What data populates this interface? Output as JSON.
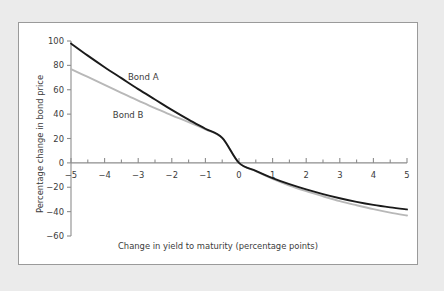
{
  "figure": {
    "background_color": "#ebebeb",
    "panel_color": "#ffffff",
    "border_color": "#9a9a9a"
  },
  "chart_data": {
    "type": "line",
    "title": "",
    "subtitle": "",
    "xlabel": "Change in yield to maturity (percentage points)",
    "ylabel": "Percentage change in bond price",
    "xlim": [
      -5,
      5
    ],
    "ylim": [
      -60,
      100
    ],
    "xticks": [
      -5,
      -4,
      -3,
      -2,
      -1,
      0,
      1,
      2,
      3,
      4,
      5
    ],
    "xtick_labels": [
      "−5",
      "−4",
      "−3",
      "−2",
      "−1",
      "0",
      "1",
      "2",
      "3",
      "4",
      "5"
    ],
    "x_minor_tick_interval": 0.5,
    "yticks": [
      -60,
      -40,
      -20,
      0,
      20,
      40,
      60,
      80,
      100
    ],
    "ytick_labels": [
      "−60",
      "−40",
      "−20",
      "0",
      "20",
      "40",
      "60",
      "80",
      "100"
    ],
    "grid": false,
    "legend_position": "inline-annotation",
    "axis_color": "#8d8d8d",
    "x": [
      -5,
      -4.5,
      -4,
      -3.5,
      -3,
      -2.5,
      -2,
      -1.5,
      -1,
      -0.5,
      0,
      0.5,
      1,
      1.5,
      2,
      2.5,
      3,
      3.5,
      4,
      4.5,
      5
    ],
    "series": [
      {
        "name": "Bond A",
        "color": "#1a1a1a",
        "line_width": 1.9,
        "label_x": -2.85,
        "label_y": 68,
        "values": [
          98,
          88,
          78.5,
          69.5,
          60.5,
          52,
          43.5,
          35.5,
          28,
          20.5,
          0,
          -6.5,
          -12.5,
          -17.5,
          -21.8,
          -25.6,
          -29.0,
          -32.0,
          -34.5,
          -36.5,
          -38.2
        ]
      },
      {
        "name": "Bond B",
        "color": "#b8b8b8",
        "line_width": 1.9,
        "label_x": -3.3,
        "label_y": 37,
        "values": [
          77,
          70.5,
          64,
          57.5,
          51,
          45,
          39,
          33.5,
          27.5,
          20.5,
          0,
          -6.8,
          -13.2,
          -18.6,
          -23.2,
          -27.4,
          -31.4,
          -34.8,
          -38.0,
          -40.8,
          -43.2
        ]
      }
    ],
    "annotations": [
      {
        "text": "Bond A",
        "x": -2.85,
        "y": 68
      },
      {
        "text": "Bond B",
        "x": -3.3,
        "y": 37
      }
    ]
  }
}
